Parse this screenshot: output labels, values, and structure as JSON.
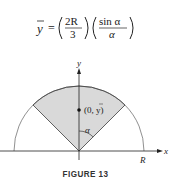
{
  "formula": {
    "lhs": "y",
    "equals": "=",
    "frac1_num": "2R",
    "frac1_den": "3",
    "frac2_num": "sin α",
    "frac2_den": "α"
  },
  "figure": {
    "axis_x_label": "x",
    "axis_y_label": "y",
    "radius_label": "R",
    "point_label": "(0, y)",
    "angle_label": "α",
    "caption": "FIGURE 13",
    "sector_fill": "#d9d9d9",
    "line_color": "#222222"
  }
}
